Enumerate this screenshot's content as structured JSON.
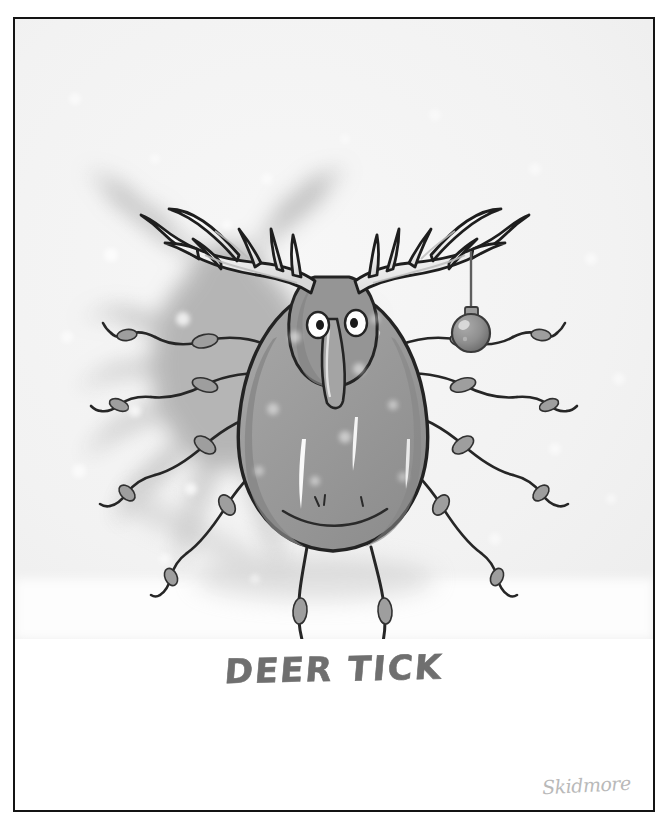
{
  "artwork": {
    "title": "DEER TICK",
    "caption": "DEER TICK",
    "signature": "Skidmore",
    "subject": "cartoon-tick-with-deer-antlers",
    "description": "A cartoon drawing of a tick whose head bears large white deer antlers, with a round ornament hanging from the right antler, set against a pale snowy background with a large soft blurred shadow behind it.",
    "medium": "ink-and-wash-cartoon",
    "elements": {
      "antlers": "white branching deer antlers with dark ink outline",
      "ornament": "gray christmas ball ornament hanging from right antler",
      "eyes": "two round white googly eyes with dark pupils",
      "snout": "long downward drooping snout",
      "body": "large teardrop shaped gray tick abdomen with white highlights",
      "legs": "eight spindly jointed ink-drawn legs",
      "shadow": "large blurred gray silhouette of the tick behind it",
      "snow": "scattered pale white snow dots over background"
    },
    "colors": {
      "frame": "#141414",
      "page": "#ffffff",
      "background": "#f3f3f3",
      "body_fill": "#9a9a9a",
      "body_shade": "#8a8a8a",
      "ink": "#1d1d1d",
      "antler_fill": "#f7f7f7",
      "antler_shade": "#c9c9c9",
      "shadow": "#b0b0b0",
      "ornament": "#8f8f8f",
      "caption_text": "#6f6f6f",
      "signature_text": "#b9b9b9"
    }
  }
}
